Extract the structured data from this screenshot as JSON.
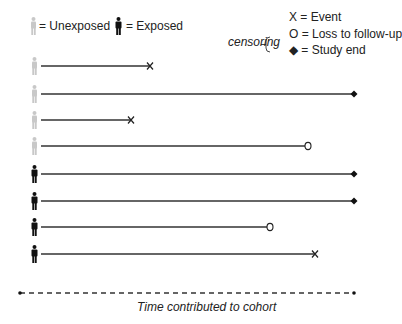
{
  "legend": {
    "unexposed_label": "= Unexposed",
    "exposed_label": "= Exposed",
    "event_label": "X = Event",
    "censoring_label": "censoring",
    "loss_label": "O = Loss to follow-up",
    "study_end_label": "◆ = Study end"
  },
  "colors": {
    "unexposed": "#c8c8c8",
    "exposed": "#111111",
    "line": "#333333"
  },
  "axis": {
    "label": "Time contributed to cohort"
  },
  "rows": [
    {
      "group": "unexposed",
      "end": 150,
      "outcome": "event"
    },
    {
      "group": "unexposed",
      "end": 354,
      "outcome": "study-end"
    },
    {
      "group": "unexposed",
      "end": 131,
      "outcome": "event"
    },
    {
      "group": "unexposed",
      "end": 308,
      "outcome": "loss"
    },
    {
      "group": "exposed",
      "end": 354,
      "outcome": "study-end"
    },
    {
      "group": "exposed",
      "end": 354,
      "outcome": "study-end"
    },
    {
      "group": "exposed",
      "end": 270,
      "outcome": "loss"
    },
    {
      "group": "exposed",
      "end": 315,
      "outcome": "event"
    }
  ]
}
